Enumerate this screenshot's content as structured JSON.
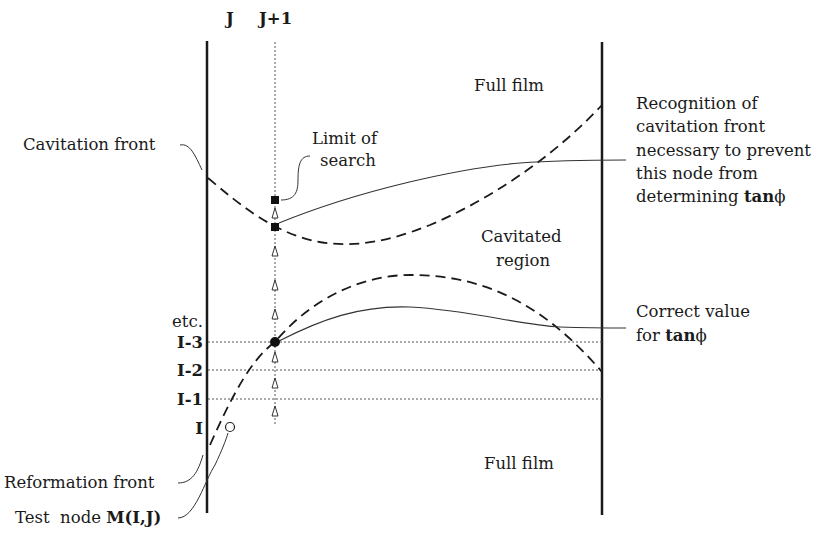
{
  "diagram": {
    "column_labels": {
      "j": "J",
      "j_plus_1": "J+1"
    },
    "row_labels": {
      "etc": "etc.",
      "i_minus_3": "I-3",
      "i_minus_2": "I-2",
      "i_minus_1": "I-1",
      "i": "I"
    },
    "region_labels": {
      "full_film_top": "Full film",
      "cavitated_line1": "Cavitated",
      "cavitated_line2": "region",
      "full_film_bottom": "Full film"
    },
    "annotations": {
      "cavitation_front": "Cavitation front",
      "limit_line1": "Limit of",
      "limit_line2": "search",
      "recognition_line1": "Recognition of",
      "recognition_line2": "cavitation front",
      "recognition_line3": "necessary to prevent",
      "recognition_line4": "this node from",
      "recognition_line5_prefix": "determining ",
      "recognition_line5_bold": "tan",
      "recognition_line5_symbol": "ϕ",
      "correct_line1": "Correct value",
      "correct_line2_prefix": "for ",
      "correct_line2_bold": "tan",
      "correct_line2_symbol": "ϕ",
      "reformation_front": "Reformation front",
      "test_node_prefix": "Test  node ",
      "test_node_bold": "M(I,J)"
    },
    "markers": {
      "limit_of_search": "filled-square",
      "cavitation_hit": "filled-square",
      "correct_node": "filled-circle",
      "test_node": "open-circle",
      "search_steps": "open-triangle"
    },
    "colors": {
      "ink": "#1a1a1a",
      "background": "#ffffff"
    }
  }
}
